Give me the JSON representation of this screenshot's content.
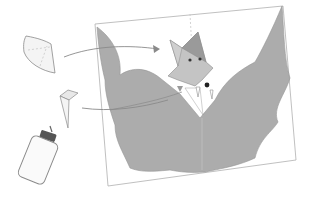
{
  "illustration": {
    "subject": "paper craft bat assembly sketch",
    "elements": [
      {
        "name": "paper-cone-piece",
        "label": "cone piece"
      },
      {
        "name": "paper-tooth-piece",
        "label": "tooth piece"
      },
      {
        "name": "glue-bottle",
        "label": "glue bottle"
      },
      {
        "name": "card-sheet",
        "label": "card"
      },
      {
        "name": "bat-body",
        "label": "bat"
      }
    ],
    "colors": {
      "background": "#ffffff",
      "pencil": "#8a8a8a",
      "bat_gray": "#a8a8a8",
      "bat_head": "#c4c4c4",
      "ear_dark": "#9a9a9a",
      "card_edge": "#b0b0b0",
      "eye": "#333333"
    }
  }
}
